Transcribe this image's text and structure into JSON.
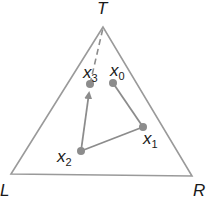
{
  "colors": {
    "triangle": "#9a9a9a",
    "path": "#8c8c8c",
    "point": "#8c8c8c",
    "text": "#1a1a1a",
    "background": "#ffffff"
  },
  "vertices": {
    "T": {
      "label": "T",
      "x": 103,
      "y": 27
    },
    "L": {
      "label": "L",
      "x": 11,
      "y": 174
    },
    "R": {
      "label": "R",
      "x": 192,
      "y": 176
    }
  },
  "points": [
    {
      "id": "x0",
      "base": "x",
      "sub": "0",
      "x": 113,
      "y": 83
    },
    {
      "id": "x1",
      "base": "x",
      "sub": "1",
      "x": 143,
      "y": 127
    },
    {
      "id": "x2",
      "base": "x",
      "sub": "2",
      "x": 81,
      "y": 151
    },
    {
      "id": "x3",
      "base": "x",
      "sub": "3",
      "x": 90,
      "y": 84
    }
  ],
  "edges": [
    {
      "from": "x0",
      "to": "x1",
      "style": "solid"
    },
    {
      "from": "x1",
      "to": "x2",
      "style": "solid"
    },
    {
      "from": "x2",
      "to": "x3",
      "style": "arrow"
    },
    {
      "from": "x3",
      "to": "T",
      "style": "dashed"
    }
  ],
  "labels": {
    "T": "T",
    "L": "L",
    "R": "R",
    "x0_base": "x",
    "x0_sub": "0",
    "x1_base": "x",
    "x1_sub": "1",
    "x2_base": "x",
    "x2_sub": "2",
    "x3_base": "x",
    "x3_sub": "3"
  }
}
